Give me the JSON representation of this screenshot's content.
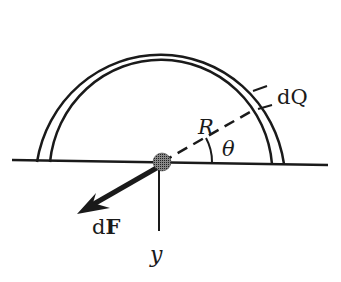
{
  "diagram": {
    "labels": {
      "charge_element": "dQ",
      "radius": "R",
      "angle": "θ",
      "force_d": "d",
      "force_F": "F",
      "axis": "y"
    },
    "colors": {
      "stroke": "#1a1a1a",
      "background": "#ffffff"
    }
  }
}
